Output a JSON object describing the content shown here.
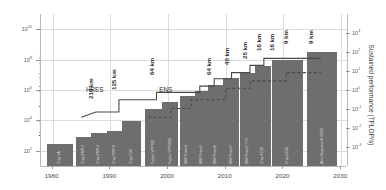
{
  "chart_data": {
    "type": "bar",
    "title": "",
    "xlabel": "",
    "ylabel": "Number of model grid points",
    "ylabel_right": "Sustained performance (TFLOP/s)",
    "grid": true,
    "legend": "none",
    "xlim": [
      1978,
      2031
    ],
    "xticks": [
      "1980",
      "1990",
      "2000",
      "2010",
      "2020",
      "2030"
    ],
    "xtick_values": [
      1980,
      1990,
      2000,
      2010,
      2020,
      2030
    ],
    "ylim_left": [
      10,
      100000000000
    ],
    "yticks_left_mantissa": [
      "10",
      "10",
      "10",
      "10",
      "10"
    ],
    "yticks_left_exponent": [
      "10",
      "8",
      "6",
      "4",
      "2"
    ],
    "ytick_left_values": [
      10000000000,
      100000000,
      1000000,
      10000,
      100
    ],
    "ylim_right": [
      0.0001,
      10000
    ],
    "yticks_right_mantissa": [
      "10",
      "10",
      "10",
      "10",
      "10",
      "10",
      "10"
    ],
    "yticks_right_exponent": [
      "3",
      "2",
      "1",
      "0",
      "-1",
      "-2",
      "-3"
    ],
    "ytick_right_values": [
      1000,
      100,
      10,
      1,
      0.1,
      0.01,
      0.001
    ],
    "bars": [
      {
        "label": "Cray 1A",
        "year": 1979.0,
        "width": 4.6,
        "value": 300
      },
      {
        "label": "Cray XMP-2",
        "year": 1984.0,
        "width": 2.7,
        "value": 800
      },
      {
        "label": "Cray XMP-4",
        "year": 1986.6,
        "width": 2.9,
        "value": 1600
      },
      {
        "label": "Cray YMP-8",
        "year": 1989.5,
        "width": 2.6,
        "value": 1900
      },
      {
        "label": "Cray C90",
        "year": 1992.1,
        "width": 3.3,
        "value": 9000
      },
      {
        "label": "Fujitsu VPP700",
        "year": 1996.0,
        "width": 3.1,
        "value": 60000
      },
      {
        "label": "Fujitsu VPP5000",
        "year": 1999.0,
        "width": 2.8,
        "value": 160000
      },
      {
        "label": "IBM Power4",
        "year": 2002.0,
        "width": 2.6,
        "value": 400000
      },
      {
        "label": "IBM Power5",
        "year": 2004.6,
        "width": 2.5,
        "value": 900000
      },
      {
        "label": "IBM Power6",
        "year": 2007.0,
        "width": 2.5,
        "value": 2200000
      },
      {
        "label": "IBM Power7",
        "year": 2009.6,
        "width": 2.7,
        "value": 6000000
      },
      {
        "label": "IBM Power7 775",
        "year": 2012.4,
        "width": 2.7,
        "value": 14000000
      },
      {
        "label": "Cray XC30",
        "year": 2015.1,
        "width": 2.7,
        "value": 40000000
      },
      {
        "label": "Cray XC40",
        "year": 2018.0,
        "width": 5.3,
        "value": 90000000
      },
      {
        "label": "Atos Sequana XH2000",
        "year": 2024.1,
        "width": 5.2,
        "value": 300000000
      }
    ],
    "series": [
      {
        "name": "HRES",
        "style": "solid",
        "line_label": "HRES",
        "line_label_year": 1987.3,
        "points": [
          {
            "year": 1985.0,
            "value": 16000
          },
          {
            "year": 1987.5,
            "value": 36000
          },
          {
            "year": 1991.5,
            "value": 36000
          },
          {
            "year": 1991.5,
            "value": 230000
          },
          {
            "year": 1998.0,
            "value": 230000
          },
          {
            "year": 1998.0,
            "value": 700000
          },
          {
            "year": 2005.5,
            "value": 700000
          },
          {
            "year": 2005.5,
            "value": 1800000
          },
          {
            "year": 2008.0,
            "value": 1800000
          },
          {
            "year": 2008.0,
            "value": 5500000
          },
          {
            "year": 2011.0,
            "value": 5500000
          },
          {
            "year": 2011.0,
            "value": 14000000
          },
          {
            "year": 2014.2,
            "value": 14000000
          },
          {
            "year": 2014.2,
            "value": 42000000
          },
          {
            "year": 2016.6,
            "value": 42000000
          },
          {
            "year": 2016.6,
            "value": 120000000
          },
          {
            "year": 2026.5,
            "value": 120000000
          }
        ]
      },
      {
        "name": "ENS",
        "style": "dashed",
        "line_label": "ENS",
        "line_label_year": 1999.6,
        "points": [
          {
            "year": 1996.5,
            "value": 16000
          },
          {
            "year": 2000.5,
            "value": 16000
          },
          {
            "year": 2000.5,
            "value": 60000
          },
          {
            "year": 2004.0,
            "value": 60000
          },
          {
            "year": 2004.0,
            "value": 230000
          },
          {
            "year": 2010.0,
            "value": 230000
          },
          {
            "year": 2010.0,
            "value": 1300000
          },
          {
            "year": 2014.2,
            "value": 1300000
          },
          {
            "year": 2014.2,
            "value": 4000000
          },
          {
            "year": 2020.5,
            "value": 4000000
          },
          {
            "year": 2020.5,
            "value": 14000000
          },
          {
            "year": 2026.5,
            "value": 14000000
          }
        ]
      }
    ],
    "annotations": [
      {
        "text": "210 km",
        "year": 1987.2,
        "value": 700000
      },
      {
        "text": "125 km",
        "year": 1991.2,
        "value": 3000000
      },
      {
        "text": "64 km",
        "year": 1997.7,
        "value": 28000000
      },
      {
        "text": "64 km",
        "year": 2007.7,
        "value": 28000000
      },
      {
        "text": "40 km",
        "year": 2010.7,
        "value": 120000000
      },
      {
        "text": "25 km",
        "year": 2013.9,
        "value": 330000000
      },
      {
        "text": "16 km",
        "year": 2016.3,
        "value": 1000000000
      },
      {
        "text": "16 km",
        "year": 2018.5,
        "value": 1000000000
      },
      {
        "text": "9 km",
        "year": 2021.0,
        "value": 3000000000
      },
      {
        "text": "9 km",
        "year": 2025.3,
        "value": 3000000000
      }
    ],
    "colors": {
      "bar_fill": "#6e6e6e",
      "line_hres": "#4a4a4a",
      "line_ens": "#4a4a4a",
      "grid": "#dcdcdc",
      "axis": "#b8b8b8",
      "text": "#3a3a3a"
    }
  }
}
